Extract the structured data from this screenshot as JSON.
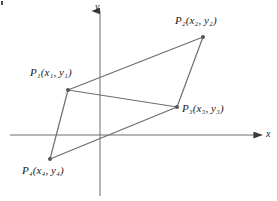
{
  "figure": {
    "width": 277,
    "height": 201,
    "background": "#ffffff",
    "line_color": "#6e6e6e",
    "axis_color": "#6e6e6e",
    "vertex_color": "#555555",
    "text_color": "#1a1a1a"
  },
  "axes": {
    "x_axis": {
      "label": "x",
      "label_x": 266,
      "label_y": 129,
      "x1": 10,
      "y1": 135,
      "x2": 262,
      "y2": 135
    },
    "y_axis": {
      "label": "y",
      "label_x": 95,
      "label_y": 2,
      "x1": 100,
      "y1": 196,
      "x2": 100,
      "y2": 11
    }
  },
  "points": [
    {
      "id": "P1",
      "label": "P₁(x₁, y₁)",
      "cx": 68,
      "cy": 90,
      "label_x": 30,
      "label_y": 67
    },
    {
      "id": "P2",
      "label": "P₂(x₂, y₂)",
      "cx": 203,
      "cy": 37,
      "label_x": 175,
      "label_y": 15
    },
    {
      "id": "P3",
      "label": "P₃(x₃, y₃)",
      "cx": 177,
      "cy": 107,
      "label_x": 182,
      "label_y": 103
    },
    {
      "id": "P4",
      "label": "P₄(x₄, y₄)",
      "cx": 50,
      "cy": 159,
      "label_x": 22,
      "label_y": 165
    }
  ],
  "edges": [
    {
      "id": "P1-P2",
      "x1": 68,
      "y1": 90,
      "x2": 203,
      "y2": 37
    },
    {
      "id": "P2-P3",
      "x1": 203,
      "y1": 37,
      "x2": 177,
      "y2": 107
    },
    {
      "id": "P3-P4",
      "x1": 177,
      "y1": 107,
      "x2": 50,
      "y2": 159
    },
    {
      "id": "P4-P1",
      "x1": 50,
      "y1": 159,
      "x2": 68,
      "y2": 90
    },
    {
      "id": "P1-P3",
      "x1": 68,
      "y1": 90,
      "x2": 177,
      "y2": 107
    }
  ]
}
